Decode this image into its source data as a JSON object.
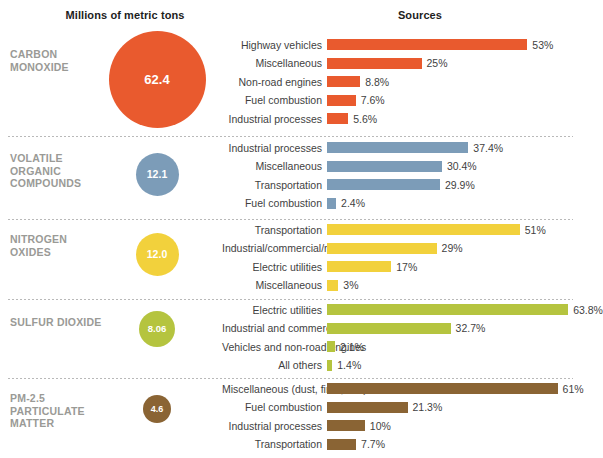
{
  "headers": {
    "tons": "Millions of metric tons",
    "sources": "Sources"
  },
  "chart_data": {
    "type": "bar",
    "title": "",
    "xlabel": "",
    "ylabel": "",
    "grid": false,
    "legend": "none",
    "bubble_unit": "millions of metric tons",
    "bar_unit": "percent of sources",
    "xlim": [
      0,
      100
    ],
    "groups": [
      {
        "name": "CARBON MONOXIDE",
        "total": "62.4",
        "total_value": 62.4,
        "color": "#E95A2E",
        "bubble_diameter": 97,
        "bubble_font": 13,
        "categories": [
          "Highway vehicles",
          "Miscellaneous",
          "Non-road engines",
          "Fuel combustion",
          "Industrial processes"
        ],
        "values": [
          53,
          25,
          8.8,
          7.6,
          5.6
        ],
        "labels": [
          "53%",
          "25%",
          "8.8%",
          "7.6%",
          "5.6%"
        ]
      },
      {
        "name": "VOLATILE ORGANIC COMPOUNDS",
        "total": "12.1",
        "total_value": 12.1,
        "color": "#7C9CB8",
        "bubble_diameter": 43,
        "bubble_font": 10.5,
        "categories": [
          "Industrial processes",
          "Miscellaneous",
          "Transportation",
          "Fuel combustion"
        ],
        "values": [
          37.4,
          30.4,
          29.9,
          2.4
        ],
        "labels": [
          "37.4%",
          "30.4%",
          "29.9%",
          "2.4%"
        ]
      },
      {
        "name": "NITROGEN OXIDES",
        "total": "12.0",
        "total_value": 12.0,
        "color": "#F2D13C",
        "bubble_diameter": 43,
        "bubble_font": 10.5,
        "categories": [
          "Transportation",
          "Industrial/commercial/residential",
          "Electric utilities",
          "Miscellaneous"
        ],
        "values": [
          51,
          29,
          17,
          3
        ],
        "labels": [
          "51%",
          "29%",
          "17%",
          "3%"
        ]
      },
      {
        "name": "SULFUR DIOXIDE",
        "total": "8.06",
        "total_value": 8.06,
        "color": "#B5C43F",
        "bubble_diameter": 36,
        "bubble_font": 9.5,
        "categories": [
          "Electric utilities",
          "Industrial and commercial facilities",
          "Vehicles and non-road engines",
          "All others"
        ],
        "values": [
          63.8,
          32.7,
          2.1,
          1.4
        ],
        "labels": [
          "63.8%",
          "32.7%",
          "2.1%",
          "1.4%"
        ]
      },
      {
        "name": "PM-2.5 PARTICULATE MATTER",
        "total": "4.6",
        "total_value": 4.6,
        "color": "#8A6434",
        "bubble_diameter": 28,
        "bubble_font": 9,
        "categories": [
          "Miscellaneous (dust, fires, etc.)",
          "Fuel combustion",
          "Industrial processes",
          "Transportation"
        ],
        "values": [
          61,
          21.3,
          10,
          7.7
        ],
        "labels": [
          "61%",
          "21.3%",
          "10%",
          "7.7%"
        ]
      }
    ]
  },
  "layout": {
    "group_tops": [
      27,
      136,
      219,
      299,
      378
    ],
    "group_heights": [
      109,
      83,
      80,
      79,
      80
    ],
    "bubble_center_x": 157,
    "bubble_centers_y": [
      79,
      174,
      254,
      329,
      409
    ],
    "name_tops": [
      48,
      152,
      233,
      316,
      392
    ],
    "sources_tops": [
      37,
      140,
      222,
      302,
      381
    ],
    "bar_scale_px_per_pct": 3.78
  }
}
